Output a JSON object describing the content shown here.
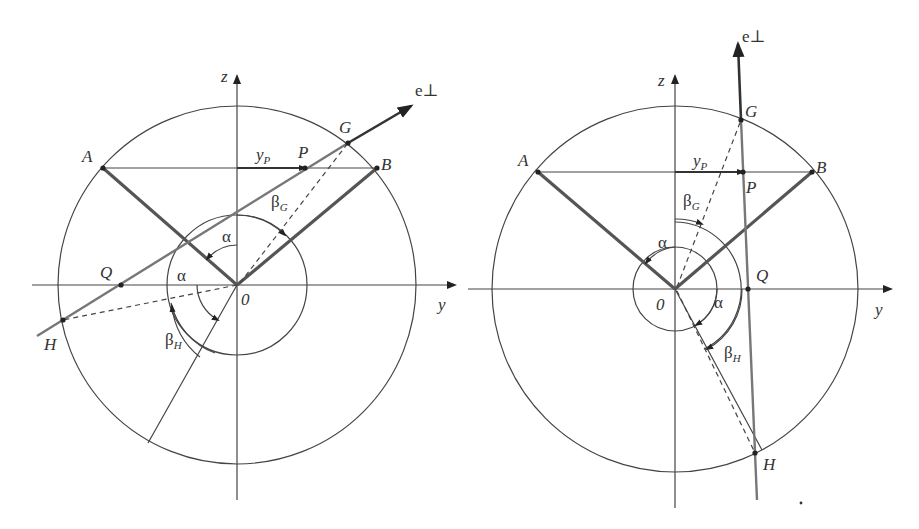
{
  "figure": {
    "panels": [
      {
        "id": "left",
        "labels": {
          "z_axis": "z",
          "y_axis": "y",
          "origin": "0",
          "e_perp": "e⊥",
          "A": "A",
          "B": "B",
          "P": "P",
          "G": "G",
          "Q": "Q",
          "H": "H",
          "y_p_main": "y",
          "y_p_sub": "P",
          "alpha_1": "α",
          "alpha_2": "α",
          "beta_g_main": "β",
          "beta_g_sub": "G",
          "beta_h_main": "β",
          "beta_h_sub": "H"
        }
      },
      {
        "id": "right",
        "labels": {
          "z_axis": "z",
          "y_axis": "y",
          "origin": "0",
          "e_perp": "e⊥",
          "A": "A",
          "B": "B",
          "P": "P",
          "G": "G",
          "Q": "Q",
          "H": "H",
          "y_p_main": "y",
          "y_p_sub": "P",
          "alpha_1": "α",
          "alpha_2": "α",
          "beta_g_main": "β",
          "beta_g_sub": "G",
          "beta_h_main": "β",
          "beta_h_sub": "H"
        }
      }
    ],
    "colors": {
      "ink": "#333333",
      "thick_line": "#555555",
      "gray_line": "#777777",
      "background": "#ffffff"
    }
  }
}
